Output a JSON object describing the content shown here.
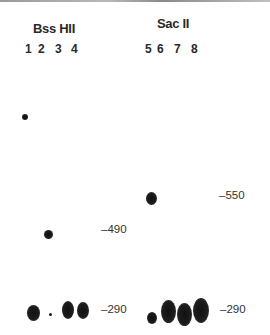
{
  "figure": {
    "type": "southern blot / gel autoradiograph",
    "groups": [
      {
        "enzyme": "Bss HII",
        "lanes": [
          "1",
          "2",
          "3",
          "4"
        ]
      },
      {
        "enzyme": "Sac II",
        "lanes": [
          "5",
          "6",
          "7",
          "8"
        ]
      }
    ],
    "size_markers": [
      {
        "label": "–490",
        "position": "left-group"
      },
      {
        "label": "–290",
        "position": "left-group-bottom"
      },
      {
        "label": "–550",
        "position": "right-group"
      },
      {
        "label": "–290",
        "position": "right-group-bottom"
      }
    ],
    "bands": [
      {
        "lane": "1",
        "note": "high band (small dot)"
      },
      {
        "lane": "1",
        "note": "290 band"
      },
      {
        "lane": "2",
        "note": "faint 290 band"
      },
      {
        "lane": "3",
        "note": "490 band"
      },
      {
        "lane": "3",
        "note": "290 band"
      },
      {
        "lane": "4",
        "note": "290 band"
      },
      {
        "lane": "5",
        "note": "290 band"
      },
      {
        "lane": "6",
        "note": "550 band"
      },
      {
        "lane": "6",
        "note": "290 band"
      },
      {
        "lane": "7",
        "note": "290 band"
      },
      {
        "lane": "8",
        "note": "290 band"
      }
    ]
  },
  "labels": {
    "left_enzyme": "Bss HII",
    "right_enzyme": "Sac II",
    "lane_1": "1",
    "lane_2": "2",
    "lane_3": "3",
    "lane_4": "4",
    "lane_5": "5",
    "lane_6": "6",
    "lane_7": "7",
    "lane_8": "8",
    "marker_490": "–490",
    "marker_290_left": "–290",
    "marker_550": "–550",
    "marker_290_right": "–290"
  }
}
